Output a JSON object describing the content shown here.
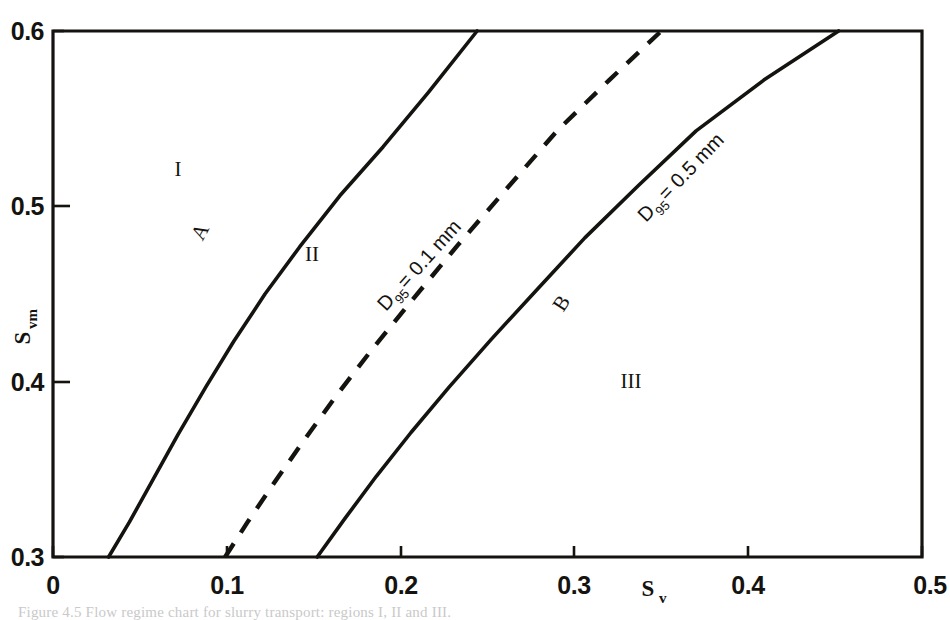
{
  "figure": {
    "background_color": "#ffffff",
    "ink_color": "#15130f",
    "caption_fragment": "Figure 4.5 Flow regime chart for slurry transport: regions I, II and III."
  },
  "chart_data": {
    "type": "line",
    "title": "",
    "xlabel": "Sv",
    "xlabel_base": "S",
    "xlabel_sub": "v",
    "ylabel": "Svm",
    "ylabel_base": "S",
    "ylabel_sub": "vm",
    "xlim": [
      0,
      0.5
    ],
    "ylim": [
      0.3,
      0.6
    ],
    "grid": false,
    "legend": "none",
    "xticks": [
      0,
      0.1,
      0.2,
      0.3,
      0.4,
      0.5
    ],
    "xtick_labels": [
      "0",
      "0.1",
      "0.2",
      "0.3",
      "0.4",
      "0.5"
    ],
    "yticks": [
      0.3,
      0.4,
      0.5,
      0.6
    ],
    "ytick_labels": [
      "0.3",
      "0.4",
      "0.5",
      "0.6"
    ],
    "series": [
      {
        "name": "A",
        "style": "solid",
        "label": "A",
        "label_point": [
          0.088,
          0.487
        ],
        "points": [
          [
            0.032,
            0.3
          ],
          [
            0.044,
            0.32
          ],
          [
            0.058,
            0.345
          ],
          [
            0.072,
            0.37
          ],
          [
            0.088,
            0.397
          ],
          [
            0.104,
            0.423
          ],
          [
            0.122,
            0.45
          ],
          [
            0.142,
            0.477
          ],
          [
            0.165,
            0.506
          ],
          [
            0.19,
            0.534
          ],
          [
            0.216,
            0.565
          ],
          [
            0.244,
            0.6
          ]
        ]
      },
      {
        "name": "D95 = 0.1 mm",
        "style": "dashed",
        "label_base": "D",
        "label_sub": "95",
        "label_rest": " = 0.1 mm",
        "label_full": "D95 = 0.1 mm",
        "label_point": [
          0.185,
          0.452
        ],
        "points": [
          [
            0.099,
            0.3
          ],
          [
            0.112,
            0.32
          ],
          [
            0.127,
            0.342
          ],
          [
            0.144,
            0.366
          ],
          [
            0.163,
            0.392
          ],
          [
            0.184,
            0.419
          ],
          [
            0.207,
            0.447
          ],
          [
            0.233,
            0.478
          ],
          [
            0.261,
            0.51
          ],
          [
            0.29,
            0.543
          ],
          [
            0.32,
            0.572
          ],
          [
            0.35,
            0.6
          ]
        ]
      },
      {
        "name": "D95 = 0.5 mm",
        "style": "solid",
        "label_base": "D",
        "label_sub": "95",
        "label_rest": " = 0.5 mm",
        "label_full": "D95 = 0.5 mm",
        "label_point": [
          0.352,
          0.505
        ],
        "secondary_label": "B",
        "secondary_label_point": [
          0.295,
          0.428
        ],
        "points": [
          [
            0.152,
            0.3
          ],
          [
            0.168,
            0.322
          ],
          [
            0.186,
            0.346
          ],
          [
            0.206,
            0.371
          ],
          [
            0.228,
            0.397
          ],
          [
            0.252,
            0.424
          ],
          [
            0.278,
            0.452
          ],
          [
            0.306,
            0.482
          ],
          [
            0.337,
            0.512
          ],
          [
            0.37,
            0.543
          ],
          [
            0.409,
            0.572
          ],
          [
            0.452,
            0.6
          ]
        ]
      }
    ],
    "annotations": [
      {
        "text": "I",
        "x": 0.062,
        "y": 0.533,
        "role": "region-label"
      },
      {
        "text": "II",
        "x": 0.152,
        "y": 0.482,
        "role": "region-label"
      },
      {
        "text": "III",
        "x": 0.34,
        "y": 0.41,
        "role": "region-label"
      },
      {
        "text": "A",
        "x": 0.088,
        "y": 0.487,
        "role": "curve-letter"
      },
      {
        "text": "B",
        "x": 0.295,
        "y": 0.428,
        "role": "curve-letter"
      }
    ]
  }
}
